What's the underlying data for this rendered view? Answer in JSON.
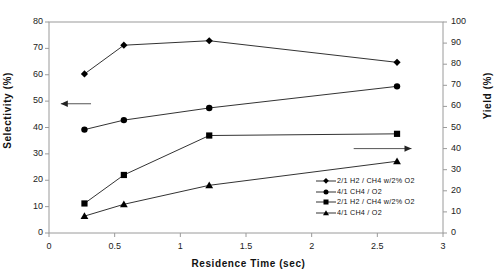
{
  "chart_data": {
    "type": "line",
    "title": "",
    "xlabel": "Residence Time (sec)",
    "ylabel": "Selectivity (%)",
    "y2label": "Yield (%)",
    "xlim": [
      0,
      3
    ],
    "ylim": [
      0,
      80
    ],
    "y2lim": [
      0,
      100
    ],
    "grid": false,
    "legend_position": "inside-lower-right",
    "xticks": [
      "0",
      "0.5",
      "1",
      "1.5",
      "2",
      "2.5",
      "3"
    ],
    "xtick_values": [
      0,
      0.5,
      1,
      1.5,
      2,
      2.5,
      3
    ],
    "yticks": [
      "0",
      "10",
      "20",
      "30",
      "40",
      "50",
      "60",
      "70",
      "80"
    ],
    "ytick_values": [
      0,
      10,
      20,
      30,
      40,
      50,
      60,
      70,
      80
    ],
    "y2ticks": [
      "0",
      "10",
      "20",
      "30",
      "40",
      "50",
      "60",
      "70",
      "80",
      "90",
      "100"
    ],
    "y2tick_values": [
      0,
      10,
      20,
      30,
      40,
      50,
      60,
      70,
      80,
      90,
      100
    ],
    "x": [
      0.27,
      0.57,
      1.22,
      2.65
    ],
    "series": [
      {
        "name": "2/1 H2 / CH4 w/2% O2",
        "marker": "diamond",
        "axis": "left",
        "values": [
          60.3,
          71.2,
          72.9,
          64.7
        ]
      },
      {
        "name": "4/1 CH4 / O2",
        "marker": "circle",
        "axis": "left",
        "values": [
          39.2,
          42.8,
          47.4,
          55.6
        ]
      },
      {
        "name": "2/1 H2 / CH4 w/2% O2",
        "marker": "square",
        "axis": "right",
        "values": [
          14.0,
          27.5,
          46.2,
          47.0
        ]
      },
      {
        "name": "4/1 CH4 / O2",
        "marker": "triangle",
        "axis": "right",
        "values": [
          8.0,
          13.6,
          22.6,
          34.0
        ]
      }
    ],
    "annotations": [
      {
        "name": "left-axis-arrow",
        "direction": "left",
        "axis": "left",
        "y": 49.0,
        "x_from": 0.32,
        "x_to": 0.09
      },
      {
        "name": "right-axis-arrow",
        "direction": "right",
        "axis": "right",
        "y": 40.0,
        "x_from": 2.32,
        "x_to": 2.76
      }
    ]
  },
  "legend": {
    "items": [
      {
        "label": "2/1 H2 / CH4 w/2% O2",
        "marker": "diamond"
      },
      {
        "label": "4/1 CH4 / O2",
        "marker": "circle"
      },
      {
        "label": "2/1 H2 / CH4 w/2% O2",
        "marker": "square"
      },
      {
        "label": "4/1 CH4 / O2",
        "marker": "triangle"
      }
    ]
  },
  "colors": {
    "line": "#333333",
    "marker": "#000000",
    "axis": "#9a9a9a",
    "text": "#111111",
    "background": "#ffffff"
  }
}
